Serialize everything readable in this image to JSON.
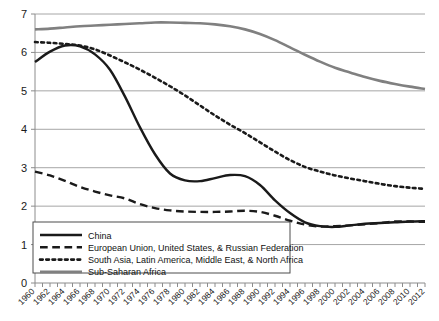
{
  "chart_data": {
    "type": "line",
    "title": "",
    "subtitle": "",
    "xlabel": "",
    "ylabel": "",
    "xlim": [
      1960,
      2012
    ],
    "ylim": [
      0,
      7
    ],
    "grid": "horizontal",
    "legend_position": "lower-left-inside",
    "y_ticks": [
      "0",
      "1",
      "2",
      "3",
      "4",
      "5",
      "6",
      "7"
    ],
    "x_ticks": [
      "1960",
      "1962",
      "1964",
      "1966",
      "1968",
      "1970",
      "1972",
      "1974",
      "1976",
      "1978",
      "1980",
      "1982",
      "1984",
      "1986",
      "1988",
      "1990",
      "1992",
      "1994",
      "1996",
      "1998",
      "2000",
      "2002",
      "2004",
      "2006",
      "2008",
      "2010",
      "2012"
    ],
    "x": [
      1960,
      1962,
      1964,
      1966,
      1968,
      1970,
      1972,
      1974,
      1976,
      1978,
      1980,
      1982,
      1984,
      1986,
      1988,
      1990,
      1992,
      1994,
      1996,
      1998,
      2000,
      2002,
      2004,
      2006,
      2008,
      2010,
      2012
    ],
    "series": [
      {
        "name": "China",
        "style": "solid",
        "color": "#1a1a1a",
        "width": 2.4,
        "values": [
          5.75,
          6.02,
          6.18,
          6.16,
          5.95,
          5.55,
          4.85,
          4.05,
          3.35,
          2.85,
          2.67,
          2.65,
          2.73,
          2.81,
          2.78,
          2.55,
          2.15,
          1.82,
          1.58,
          1.48,
          1.46,
          1.5,
          1.54,
          1.56,
          1.58,
          1.6,
          1.61
        ]
      },
      {
        "name": "European Union, United States, & Russian Federation",
        "style": "dashed",
        "color": "#1a1a1a",
        "width": 2.4,
        "values": [
          2.9,
          2.8,
          2.66,
          2.5,
          2.38,
          2.28,
          2.2,
          2.05,
          1.95,
          1.89,
          1.86,
          1.85,
          1.85,
          1.86,
          1.88,
          1.85,
          1.75,
          1.62,
          1.52,
          1.47,
          1.48,
          1.5,
          1.53,
          1.56,
          1.6,
          1.6,
          1.59
        ]
      },
      {
        "name": "South Asia, Latin America, Middle East, & North Africa",
        "style": "dotted",
        "color": "#1a1a1a",
        "width": 2.6,
        "values": [
          6.27,
          6.25,
          6.22,
          6.18,
          6.08,
          5.92,
          5.74,
          5.55,
          5.34,
          5.12,
          4.88,
          4.62,
          4.36,
          4.12,
          3.9,
          3.66,
          3.42,
          3.2,
          3.02,
          2.9,
          2.8,
          2.72,
          2.65,
          2.58,
          2.52,
          2.48,
          2.45
        ]
      },
      {
        "name": "Sub-Saharan Africa",
        "style": "solid",
        "color": "#808080",
        "width": 2.6,
        "values": [
          6.6,
          6.62,
          6.65,
          6.68,
          6.7,
          6.72,
          6.74,
          6.76,
          6.78,
          6.78,
          6.77,
          6.76,
          6.73,
          6.68,
          6.6,
          6.48,
          6.32,
          6.13,
          5.94,
          5.76,
          5.6,
          5.48,
          5.36,
          5.26,
          5.18,
          5.11,
          5.05
        ]
      }
    ]
  },
  "legend": {
    "items": [
      {
        "label": "China",
        "style": "solid",
        "color": "#1a1a1a"
      },
      {
        "label": "European Union, United States, & Russian Federation",
        "style": "dashed",
        "color": "#1a1a1a"
      },
      {
        "label": "South Asia, Latin America, Middle East, & North Africa",
        "style": "dotted",
        "color": "#1a1a1a"
      },
      {
        "label": "Sub-Saharan Africa",
        "style": "solid",
        "color": "#808080"
      }
    ]
  },
  "colors": {
    "grid": "#a6a6a6",
    "axis": "#808080",
    "plot_background": "#ffffff",
    "series_dark": "#1a1a1a",
    "series_gray": "#808080"
  }
}
